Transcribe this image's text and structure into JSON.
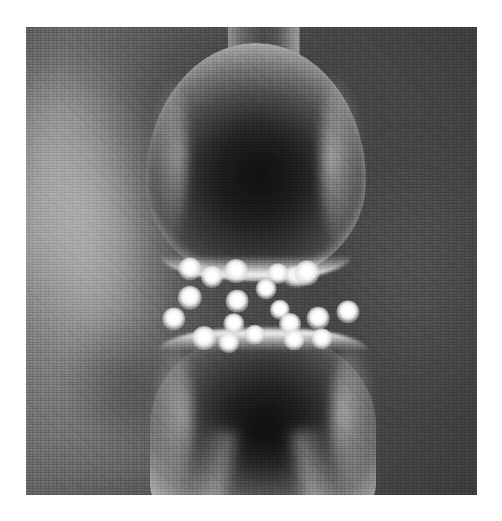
{
  "figure": {
    "kind": "scientific-micrograph-illustration",
    "rendering": "grayscale halftone print",
    "caption": "",
    "canvas": {
      "width": 502,
      "height": 521,
      "background": "#ffffff"
    },
    "plate": {
      "left": 26,
      "top": 27,
      "width": 451,
      "height": 468,
      "margin_color": "#ffffff",
      "field_color_light": "#757575",
      "field_color_dark": "#464646"
    }
  },
  "structures": {
    "presynaptic": {
      "label": "presynaptic terminal",
      "description": "flask-shaped axon terminal with narrow neck widening into a bulb",
      "fill_dark": "#252525",
      "rim_light": "#d6d6d6"
    },
    "postsynaptic": {
      "label": "postsynaptic terminal",
      "description": "rounded dome tapering downward",
      "fill_dark": "#242424",
      "rim_light": "#d6d6d6"
    },
    "background_structure": {
      "label": "out-of-focus background process",
      "description": "blurred soft-focus neural process at left of field"
    },
    "release_site": {
      "label": "vesicle fusion site",
      "description": "bright bump on presynaptic membrane where a vesicle fuses"
    },
    "cleft": {
      "label": "synaptic cleft",
      "description": "gap between the two membranes containing neurotransmitter particles"
    }
  },
  "particles": {
    "label": "neurotransmitter particles",
    "color": "#ffffff",
    "count": 19,
    "points": [
      {
        "x": 164,
        "y": 242,
        "r": 8.0
      },
      {
        "x": 186,
        "y": 250,
        "r": 7.6
      },
      {
        "x": 210,
        "y": 244,
        "r": 8.2
      },
      {
        "x": 252,
        "y": 247,
        "r": 7.4
      },
      {
        "x": 281,
        "y": 246,
        "r": 8.6
      },
      {
        "x": 164,
        "y": 271,
        "r": 8.4
      },
      {
        "x": 211,
        "y": 274,
        "r": 7.8
      },
      {
        "x": 240,
        "y": 262,
        "r": 7.2
      },
      {
        "x": 254,
        "y": 283,
        "r": 7.0
      },
      {
        "x": 208,
        "y": 297,
        "r": 7.4
      },
      {
        "x": 148,
        "y": 292,
        "r": 8.0
      },
      {
        "x": 178,
        "y": 311,
        "r": 8.2
      },
      {
        "x": 203,
        "y": 316,
        "r": 7.4
      },
      {
        "x": 229,
        "y": 308,
        "r": 7.0
      },
      {
        "x": 264,
        "y": 297,
        "r": 7.6
      },
      {
        "x": 268,
        "y": 313,
        "r": 7.2
      },
      {
        "x": 292,
        "y": 291,
        "r": 7.8
      },
      {
        "x": 296,
        "y": 312,
        "r": 7.4
      },
      {
        "x": 322,
        "y": 285,
        "r": 8.0
      }
    ]
  }
}
